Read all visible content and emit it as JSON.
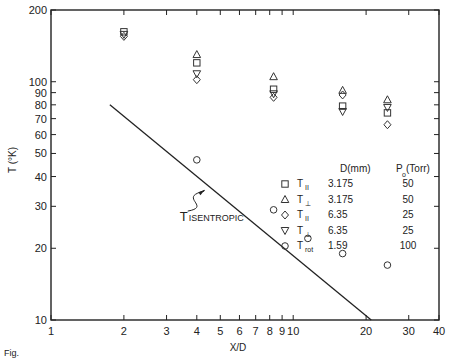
{
  "chart_data": {
    "type": "scatter",
    "title": "",
    "xlabel": "X/D",
    "ylabel": "T (°K)",
    "xscale": "log",
    "yscale": "log",
    "xlim": [
      1,
      40
    ],
    "ylim": [
      10,
      200
    ],
    "grid": false,
    "x_ticks": [
      1,
      2,
      3,
      4,
      5,
      6,
      7,
      8,
      9,
      10,
      20,
      30,
      40
    ],
    "x_tick_labels": [
      "1",
      "2",
      "3",
      "4",
      "5",
      "6",
      "7",
      "8",
      "9",
      "10",
      "20",
      "30",
      "40"
    ],
    "y_ticks": [
      10,
      20,
      30,
      40,
      50,
      60,
      70,
      80,
      90,
      100,
      200
    ],
    "y_tick_labels": [
      "10",
      "20",
      "30",
      "40",
      "50",
      "60",
      "70",
      "80",
      "90",
      "100",
      "200"
    ],
    "legend": {
      "position": "right-inside",
      "header_d": "D(mm)",
      "header_p": "P",
      "header_p_sub": "o",
      "header_p_unit": "(Torr)",
      "entries": [
        {
          "symbol": "square",
          "label": "T",
          "sub": "II",
          "D": "3.175",
          "P": "50"
        },
        {
          "symbol": "triangle-up",
          "label": "T",
          "sub": "⊥",
          "D": "3.175",
          "P": "50"
        },
        {
          "symbol": "diamond",
          "label": "T",
          "sub": "II",
          "D": "6.35",
          "P": "25"
        },
        {
          "symbol": "triangle-down",
          "label": "T",
          "sub": "⊥",
          "D": "6.35",
          "P": "25"
        },
        {
          "symbol": "circle",
          "label": "T",
          "sub": "rot",
          "D": "1.59",
          "P": "100"
        }
      ]
    },
    "series": [
      {
        "name": "T_II D=3.175 P0=50",
        "symbol": "square",
        "x": [
          2,
          4,
          8.3,
          16,
          24.5
        ],
        "y": [
          162,
          120,
          93,
          79,
          74
        ]
      },
      {
        "name": "T_perp D=3.175 P0=50",
        "symbol": "triangle-up",
        "x": [
          4,
          8.3,
          16,
          24.5
        ],
        "y": [
          130,
          105,
          92,
          84
        ]
      },
      {
        "name": "T_II D=6.35 P0=25",
        "symbol": "diamond",
        "x": [
          2,
          4,
          8.3,
          16,
          24.5
        ],
        "y": [
          155,
          102,
          86,
          88,
          66
        ]
      },
      {
        "name": "T_perp D=6.35 P0=25",
        "symbol": "triangle-down",
        "x": [
          2,
          4,
          8.3,
          16,
          24.5
        ],
        "y": [
          158,
          108,
          89,
          75,
          78
        ]
      },
      {
        "name": "T_rot D=1.59 P0=100",
        "symbol": "circle",
        "x": [
          4,
          8.3,
          11.5,
          16,
          24.5
        ],
        "y": [
          47,
          29,
          22,
          19,
          17
        ]
      }
    ],
    "lines": [
      {
        "name": "T_ISENTROPIC",
        "x": [
          1.75,
          21
        ],
        "y": [
          80,
          10
        ]
      }
    ],
    "annotations": [
      {
        "text": "T",
        "sub": "ISENTROPIC",
        "x": 3.4,
        "y": 26,
        "arrow_to": {
          "x": 4.3,
          "y": 35
        }
      }
    ],
    "caption": "Fig."
  }
}
